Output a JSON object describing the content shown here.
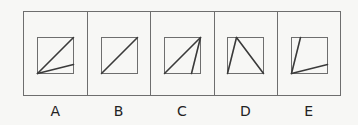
{
  "colors": {
    "line": "#3a3a3a",
    "frame": "#6e6e6e",
    "background": "#f7f7f5"
  },
  "options": [
    {
      "label": "A",
      "lines": [
        [
          0,
          1,
          1,
          0
        ],
        [
          0,
          1,
          1,
          0.75
        ]
      ]
    },
    {
      "label": "B",
      "lines": [
        [
          0,
          1,
          1,
          0
        ]
      ]
    },
    {
      "label": "C",
      "lines": [
        [
          0,
          1,
          1,
          0
        ],
        [
          0.75,
          1,
          1,
          0
        ]
      ]
    },
    {
      "label": "D",
      "lines": [
        [
          0,
          1,
          0.25,
          0
        ],
        [
          0.25,
          0,
          1,
          1
        ]
      ]
    },
    {
      "label": "E",
      "lines": [
        [
          0,
          1,
          0.25,
          0
        ],
        [
          0,
          1,
          1,
          0.75
        ]
      ]
    }
  ]
}
